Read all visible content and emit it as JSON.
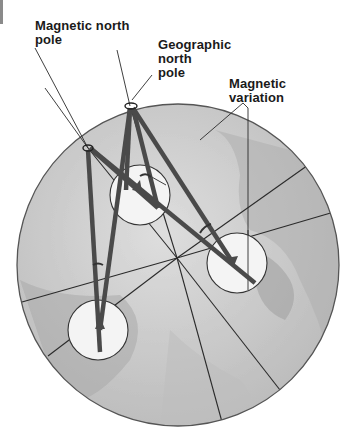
{
  "labels": {
    "magnetic_north_pole": [
      "Magnetic north",
      "pole"
    ],
    "geographic_north_pole": [
      "Geographic",
      "north",
      "pole"
    ],
    "magnetic_variation": [
      "Magnetic",
      "variation"
    ]
  },
  "colors": {
    "globe_fill": "#c8c8c8",
    "globe_outline": "#555555",
    "needle": "#4a4a4a",
    "compass_fill": "#f4f4f4",
    "line": "#2a2a2a",
    "text": "#1a1a1a"
  },
  "compasses": [
    {
      "id": "compass-top",
      "cx": 140,
      "cy": 195,
      "r": 30
    },
    {
      "id": "compass-right",
      "cx": 237,
      "cy": 263,
      "r": 30
    },
    {
      "id": "compass-bottom-left",
      "cx": 98,
      "cy": 330,
      "r": 30
    }
  ]
}
